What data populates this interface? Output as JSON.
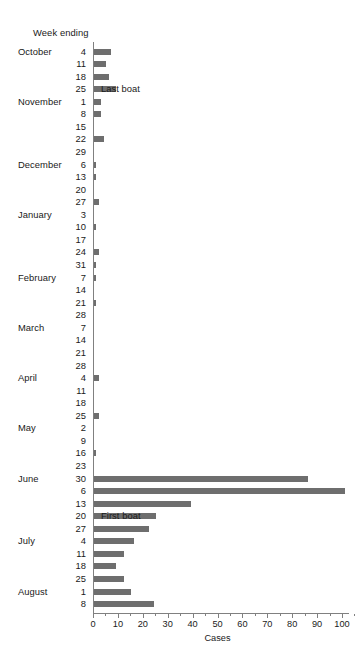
{
  "header": {
    "week_ending_label": "Week ending"
  },
  "annotations": [
    {
      "text": "Last boat",
      "row_index": 3
    },
    {
      "text": "First boat",
      "row_index": 37
    }
  ],
  "chart_data": {
    "type": "bar",
    "orientation": "horizontal",
    "title": "",
    "xlabel": "Cases",
    "ylabel": "Week ending",
    "xlim": [
      0,
      105
    ],
    "xticks": [
      0,
      10,
      20,
      30,
      40,
      50,
      60,
      70,
      80,
      90,
      100
    ],
    "xtick_labels": [
      "0",
      "10",
      "20",
      "30",
      "40",
      "50",
      "60",
      "70",
      "80",
      "90",
      "100"
    ],
    "minor_tick_step": 5,
    "grid": false,
    "legend": "none",
    "bar_color": "#6e6e6e",
    "axis_color": "#808080",
    "background": "#ffffff",
    "categories": [
      "4",
      "11",
      "18",
      "25",
      "1",
      "8",
      "15",
      "22",
      "29",
      "6",
      "13",
      "20",
      "27",
      "3",
      "10",
      "17",
      "24",
      "31",
      "7",
      "14",
      "21",
      "28",
      "7",
      "14",
      "21",
      "28",
      "4",
      "11",
      "18",
      "25",
      "2",
      "9",
      "16",
      "23",
      "30",
      "6",
      "13",
      "20",
      "27",
      "4",
      "11",
      "18",
      "25",
      "1",
      "8"
    ],
    "month_labels": [
      {
        "label": "October",
        "row_index": 0
      },
      {
        "label": "November",
        "row_index": 4
      },
      {
        "label": "December",
        "row_index": 9
      },
      {
        "label": "January",
        "row_index": 13
      },
      {
        "label": "February",
        "row_index": 18
      },
      {
        "label": "March",
        "row_index": 22
      },
      {
        "label": "April",
        "row_index": 26
      },
      {
        "label": "May",
        "row_index": 30
      },
      {
        "label": "June",
        "row_index": 34
      },
      {
        "label": "July",
        "row_index": 39
      },
      {
        "label": "August",
        "row_index": 43
      }
    ],
    "values": [
      7,
      5,
      6,
      9,
      3,
      3,
      0,
      4,
      0,
      1,
      1,
      0,
      2,
      0,
      1,
      0,
      2,
      1,
      1,
      0,
      1,
      0,
      0,
      0,
      0,
      0,
      2,
      0,
      0,
      2,
      0,
      0,
      1,
      0,
      86,
      101,
      39,
      25,
      22,
      16,
      12,
      9,
      12,
      15,
      24
    ]
  }
}
